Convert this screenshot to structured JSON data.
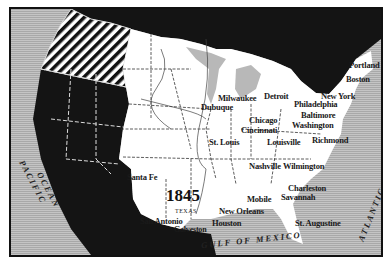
{
  "map": {
    "year": "1845",
    "state_label": "TEXAS",
    "colors": {
      "us_territory": "#ffffff",
      "foreign_territory": "#141414",
      "water": "#b8b8b8",
      "disputed_oregon": "hatched",
      "frame": "#111111"
    },
    "water_labels": {
      "pacific": "PACIFIC OCEAN",
      "pacific_line1": "PACIFIC",
      "pacific_line2": "OCEAN",
      "atlantic": "ATLANTIC OCEAN",
      "gulf": "GULF OF MEXICO"
    },
    "cities": [
      {
        "name": "Portland"
      },
      {
        "name": "Boston"
      },
      {
        "name": "New York"
      },
      {
        "name": "Philadelphia"
      },
      {
        "name": "Baltimore"
      },
      {
        "name": "Washington"
      },
      {
        "name": "Richmond"
      },
      {
        "name": "Milwaukee"
      },
      {
        "name": "Dubuque"
      },
      {
        "name": "Detroit"
      },
      {
        "name": "Chicago"
      },
      {
        "name": "Cincinnati"
      },
      {
        "name": "St. Louis"
      },
      {
        "name": "Louisville"
      },
      {
        "name": "Nashville"
      },
      {
        "name": "Wilmington"
      },
      {
        "name": "Charleston"
      },
      {
        "name": "Savannah"
      },
      {
        "name": "Mobile"
      },
      {
        "name": "New Orleans"
      },
      {
        "name": "Houston"
      },
      {
        "name": "Galveston"
      },
      {
        "name": "San Antonio"
      },
      {
        "name": "Santa Fe"
      },
      {
        "name": "St. Augustine"
      }
    ]
  }
}
